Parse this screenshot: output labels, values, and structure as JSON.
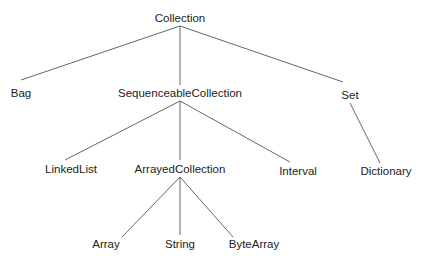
{
  "diagram": {
    "type": "class-hierarchy-tree",
    "nodes": [
      {
        "id": "collection",
        "label": "Collection",
        "x": 180,
        "y": 11
      },
      {
        "id": "bag",
        "label": "Bag",
        "x": 21,
        "y": 86
      },
      {
        "id": "sequenceable",
        "label": "SequenceableCollection",
        "x": 180,
        "y": 86
      },
      {
        "id": "set",
        "label": "Set",
        "x": 350,
        "y": 88
      },
      {
        "id": "linkedlist",
        "label": "LinkedList",
        "x": 71,
        "y": 162
      },
      {
        "id": "arrayed",
        "label": "ArrayedCollection",
        "x": 180,
        "y": 162
      },
      {
        "id": "interval",
        "label": "Interval",
        "x": 298,
        "y": 164
      },
      {
        "id": "dictionary",
        "label": "Dictionary",
        "x": 386,
        "y": 164
      },
      {
        "id": "array",
        "label": "Array",
        "x": 106,
        "y": 237
      },
      {
        "id": "string",
        "label": "String",
        "x": 180,
        "y": 237
      },
      {
        "id": "bytearray",
        "label": "ByteArray",
        "x": 254,
        "y": 237
      }
    ],
    "edges": [
      {
        "from": "collection",
        "to": "bag",
        "x1": 180,
        "y1": 26,
        "x2": 21,
        "y2": 80
      },
      {
        "from": "collection",
        "to": "sequenceable",
        "x1": 180,
        "y1": 26,
        "x2": 180,
        "y2": 85
      },
      {
        "from": "collection",
        "to": "set",
        "x1": 180,
        "y1": 26,
        "x2": 343,
        "y2": 82
      },
      {
        "from": "sequenceable",
        "to": "linkedlist",
        "x1": 180,
        "y1": 101,
        "x2": 65,
        "y2": 160
      },
      {
        "from": "sequenceable",
        "to": "arrayed",
        "x1": 180,
        "y1": 101,
        "x2": 180,
        "y2": 160
      },
      {
        "from": "sequenceable",
        "to": "interval",
        "x1": 180,
        "y1": 101,
        "x2": 290,
        "y2": 162
      },
      {
        "from": "set",
        "to": "dictionary",
        "x1": 350,
        "y1": 103,
        "x2": 380,
        "y2": 163
      },
      {
        "from": "arrayed",
        "to": "array",
        "x1": 180,
        "y1": 177,
        "x2": 122,
        "y2": 237
      },
      {
        "from": "arrayed",
        "to": "string",
        "x1": 180,
        "y1": 177,
        "x2": 180,
        "y2": 235
      },
      {
        "from": "arrayed",
        "to": "bytearray",
        "x1": 180,
        "y1": 177,
        "x2": 233,
        "y2": 237
      }
    ],
    "line_color": "#555555"
  }
}
